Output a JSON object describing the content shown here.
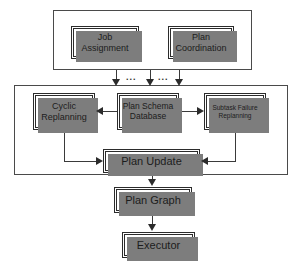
{
  "diagram": {
    "containers": [
      {
        "id": "planner-manager",
        "label": "Planner Manager"
      },
      {
        "id": "replanning-group",
        "label": ""
      }
    ],
    "nodes": [
      {
        "id": "job-assignment",
        "line1": "Job",
        "line2": "Assignment"
      },
      {
        "id": "plan-coordination",
        "line1": "Plan",
        "line2": "Coordination"
      },
      {
        "id": "cyclic-replanning",
        "line1": "Cyclic",
        "line2": "Replanning"
      },
      {
        "id": "plan-schema-db",
        "line1": "Plan Schema",
        "line2": "Database"
      },
      {
        "id": "subtask-failure",
        "line1": "Subtask Failure",
        "line2": "Replanning"
      },
      {
        "id": "plan-update",
        "line1": "Plan Update",
        "line2": ""
      },
      {
        "id": "plan-graph",
        "line1": "Plan Graph",
        "line2": ""
      },
      {
        "id": "executor",
        "line1": "Executor",
        "line2": ""
      }
    ],
    "ellipses": [
      {
        "id": "ellipsis-left",
        "text": "..."
      },
      {
        "id": "ellipsis-right",
        "text": "..."
      }
    ],
    "colors": {
      "stroke": "#3a3a3a",
      "shadow": "#7d7d7d",
      "text": "#1c1c1c",
      "background": "#ffffff"
    }
  }
}
